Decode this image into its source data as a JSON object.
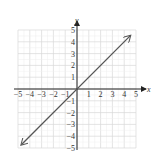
{
  "chart_data": {
    "type": "line",
    "title": "",
    "xlabel": "x",
    "ylabel": "y",
    "xlim": [
      -5,
      5
    ],
    "ylim": [
      -5,
      5
    ],
    "grid": true,
    "x_ticks": [
      "−5",
      "−4",
      "−3",
      "−2",
      "−1",
      "1",
      "2",
      "3",
      "4",
      "5"
    ],
    "y_ticks": [
      "5",
      "4",
      "3",
      "2",
      "1",
      "−1",
      "−2",
      "−3",
      "−4",
      "−5"
    ],
    "series": [
      {
        "name": "y = x",
        "equation": "y = x",
        "x": [
          -4.7,
          0,
          4.5
        ],
        "y": [
          -4.7,
          0,
          4.5
        ],
        "arrows": "both"
      }
    ],
    "colors": {
      "line": "#555555",
      "grid": "#d8d8d8",
      "axis": "#222222"
    }
  }
}
